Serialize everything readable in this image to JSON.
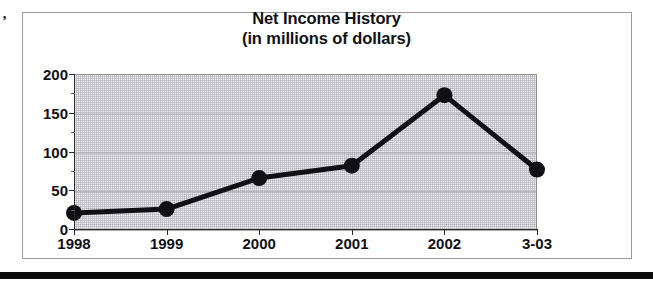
{
  "figure": {
    "margin_speck": "’",
    "background_color": "#ffffff",
    "frame_color": "#9b9b9b",
    "bottom_rule_color": "#0d0d0d"
  },
  "chart_data": {
    "type": "line",
    "title": "Net Income History",
    "subtitle": "(in millions of dollars)",
    "xlabel": "",
    "ylabel": "",
    "categories": [
      "1998",
      "1999",
      "2000",
      "2001",
      "2002",
      "3-03"
    ],
    "values": [
      22,
      27,
      67,
      83,
      174,
      78
    ],
    "ylim": [
      0,
      200
    ],
    "y_ticks": [
      0,
      50,
      100,
      150,
      200
    ],
    "y_tick_labels": [
      "0",
      "50",
      "100",
      "150",
      "200"
    ],
    "y_minor_ticks": [
      25,
      75,
      125,
      175
    ],
    "grid": true,
    "legend": null,
    "series_color": "#111115",
    "marker": "circle",
    "plot_background_color": "#f2f2f2"
  }
}
